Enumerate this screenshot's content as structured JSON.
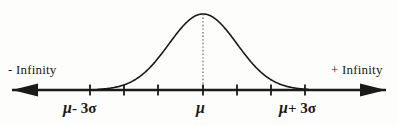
{
  "figure": {
    "background_color": "#fdfdfc",
    "ink_color": "#1a1a1a"
  },
  "labels": {
    "negative_infinity": "- Infinity",
    "positive_infinity": "+ Infinity",
    "mu_minus_3sigma": {
      "mu": "μ",
      "rest": "- 3σ"
    },
    "mu_center": {
      "mu": "μ"
    },
    "mu_plus_3sigma": {
      "mu": "μ",
      "rest": "+ 3σ"
    }
  },
  "chart_data": {
    "type": "line",
    "xlabel": "",
    "ylabel": "",
    "grid": false,
    "legend": null,
    "axis": {
      "y_pixel": 90,
      "x_start": 12,
      "x_end": 386,
      "arrow_left": true,
      "arrow_right": true
    },
    "tick_marks": {
      "count": 7,
      "x_positions": [
        90,
        124,
        158,
        203,
        237,
        271,
        305
      ],
      "sigma_values": [
        -3,
        -2,
        -1,
        0,
        1,
        2,
        3
      ],
      "height": 11
    },
    "center_line": {
      "x": 203,
      "y_top": 14,
      "y_bottom": 90,
      "style": "dotted"
    },
    "curve": {
      "mean_x": 203,
      "peak_y": 14,
      "baseline_y": 90,
      "sigma_pixels": 34,
      "x_min": 98,
      "x_max": 308,
      "stroke_width": 1.6
    },
    "annotations": [
      {
        "text": "- Infinity",
        "x": 8,
        "y": 63
      },
      {
        "text": "+ Infinity",
        "x": 331,
        "y": 63
      },
      {
        "text": "μ - 3σ",
        "x": 63,
        "y": 100
      },
      {
        "text": "μ",
        "x": 196,
        "y": 100
      },
      {
        "text": "μ + 3σ",
        "x": 279,
        "y": 100
      }
    ]
  }
}
